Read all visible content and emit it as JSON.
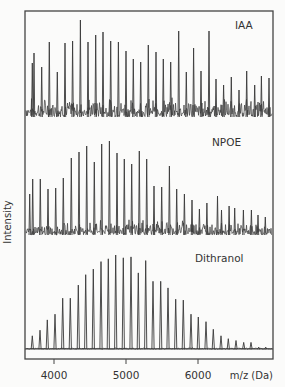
{
  "chart_data": {
    "type": "line",
    "title": "",
    "xlabel": "m/z (Da)",
    "ylabel": "Intensity",
    "xlim": [
      3670,
      7020
    ],
    "xticks": [
      4000,
      5000,
      6000
    ],
    "xtick_labels": [
      "4000",
      "5000",
      "6000"
    ],
    "grid": false,
    "legend": "none (panel labels inside each trace)",
    "panels": [
      {
        "name": "IAA",
        "label": "IAA",
        "noise_level": "high",
        "peaks": {
          "mz": [
            3699,
            3722,
            3829,
            3935,
            4046,
            4153,
            4259,
            4366,
            4472,
            4579,
            4680,
            4787,
            4894,
            5000,
            5101,
            5204,
            5310,
            5417,
            5518,
            5621,
            5732,
            5838,
            5939,
            6042,
            6153,
            6250,
            6356,
            6463,
            6569,
            6676,
            6787,
            6880,
            6986
          ],
          "intensity": [
            54,
            64,
            50,
            75,
            45,
            74,
            76,
            97,
            75,
            82,
            85,
            76,
            75,
            66,
            58,
            55,
            72,
            65,
            58,
            55,
            86,
            45,
            69,
            46,
            86,
            38,
            32,
            40,
            27,
            46,
            32,
            41,
            39
          ]
        }
      },
      {
        "name": "NPOE",
        "label": "NPOE",
        "noise_level": "medium",
        "peaks": {
          "mz": [
            3662,
            3704,
            3810,
            3917,
            4023,
            4129,
            4240,
            4347,
            4454,
            4560,
            4662,
            4769,
            4875,
            4976,
            5079,
            5185,
            5287,
            5389,
            5496,
            5603,
            5704,
            5811,
            5917,
            6019,
            6124,
            6271,
            6326,
            6432,
            6510,
            6631,
            6742,
            6833,
            6935
          ],
          "intensity": [
            41,
            56,
            56,
            46,
            47,
            57,
            77,
            83,
            89,
            73,
            91,
            94,
            82,
            76,
            71,
            84,
            76,
            49,
            48,
            69,
            46,
            41,
            35,
            26,
            32,
            39,
            25,
            29,
            27,
            25,
            25,
            20,
            18
          ]
        }
      },
      {
        "name": "Dithranol",
        "label": "Dithranol",
        "noise_level": "low",
        "peaks": {
          "mz": [
            3699,
            3806,
            3907,
            4014,
            4121,
            4226,
            4338,
            4440,
            4546,
            4653,
            4754,
            4857,
            4963,
            5069,
            5171,
            5274,
            5375,
            5482,
            5583,
            5690,
            5796,
            5903,
            6004,
            6111,
            6213,
            6319,
            6421,
            6528,
            6635,
            6736,
            6843,
            6940
          ],
          "intensity": [
            14,
            20,
            31,
            37,
            54,
            54,
            68,
            79,
            85,
            93,
            96,
            100,
            97,
            98,
            81,
            94,
            72,
            72,
            65,
            53,
            52,
            37,
            34,
            29,
            21,
            14,
            11,
            9,
            7,
            7,
            2,
            2
          ]
        }
      }
    ]
  },
  "labels": {
    "panel_iaa": "IAA",
    "panel_npoe": "NPOE",
    "panel_dithranol": "Dithranol",
    "xlabel": "m/z (Da)",
    "ylabel": "Intensity",
    "tick_4000": "4000",
    "tick_5000": "5000",
    "tick_6000": "6000"
  },
  "colors": {
    "background": "#fbfbfa",
    "ink": "#333333",
    "trace": "#3a3a3a"
  }
}
